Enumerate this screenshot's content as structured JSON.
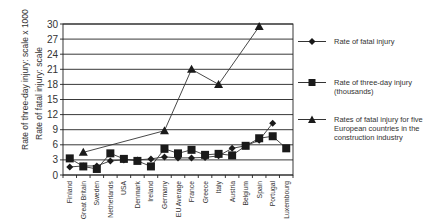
{
  "chart_data": {
    "type": "line",
    "title": "",
    "xlabel": "",
    "ylabel": "Rate of three-day injury: scale x 1000 / Rate of fatal injury: scale",
    "ylabel_lines": [
      "Rate of three-day injury: scale x 1000",
      "Rate of fatal injury: scale"
    ],
    "ylim": [
      0,
      30
    ],
    "yticks": [
      0,
      3,
      6,
      9,
      12,
      15,
      18,
      21,
      24,
      27,
      30
    ],
    "grid": true,
    "legend_position": "right",
    "categories": [
      "Finland",
      "Great Britain",
      "Sweden",
      "Netherlands",
      "USA",
      "Denmark",
      "Ireland",
      "Germany",
      "EU Average",
      "France",
      "Greece",
      "Italy",
      "Austria",
      "Belgium",
      "Spain",
      "Portugal",
      "Luxembourg"
    ],
    "series": [
      {
        "name": "Rate of fatal injury",
        "marker": "diamond",
        "values": [
          1.6,
          1.8,
          1.8,
          2.8,
          3.0,
          3.0,
          3.2,
          3.6,
          3.4,
          3.4,
          3.5,
          3.8,
          5.3,
          5.8,
          6.9,
          10.3,
          null
        ]
      },
      {
        "name": "Rate of three-day injury (thousands)",
        "marker": "square",
        "values": [
          3.3,
          1.7,
          1.2,
          4.3,
          3.2,
          2.8,
          1.7,
          5.2,
          4.3,
          5.0,
          4.0,
          4.2,
          3.9,
          5.8,
          7.3,
          7.7,
          5.3
        ]
      },
      {
        "name": "Rates of fatal injury for five European countries in the construction industry",
        "marker": "triangle",
        "values": [
          null,
          4.5,
          null,
          null,
          null,
          null,
          null,
          8.8,
          null,
          21.0,
          null,
          18.0,
          null,
          null,
          29.5,
          null,
          null
        ]
      }
    ]
  },
  "legend": {
    "items": [
      {
        "label": "Rate of fatal injury",
        "marker": "diamond"
      },
      {
        "label": "Rate of three-day injury (thousands)",
        "marker": "square"
      },
      {
        "label": "Rates of fatal injury for five European countries in the construction industry",
        "marker": "triangle"
      }
    ]
  },
  "colors": {
    "line": "#333333",
    "marker": "#1a1a1a",
    "grid": "#222222",
    "text": "#333333"
  }
}
